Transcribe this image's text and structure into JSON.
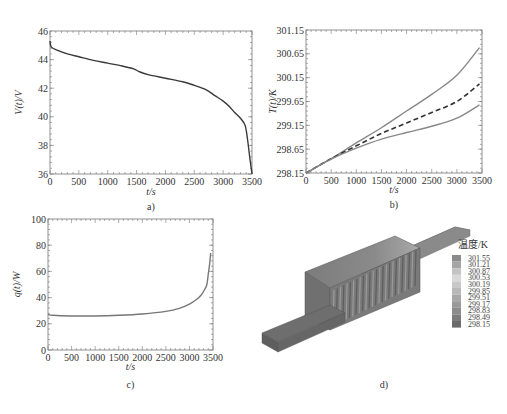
{
  "chart_data": [
    {
      "id": "a",
      "type": "line",
      "caption": "a)",
      "title": "",
      "xlabel": "t/s",
      "ylabel": "V(t)/V",
      "xlim": [
        0,
        3500
      ],
      "ylim": [
        36,
        46
      ],
      "xticks": [
        0,
        500,
        1000,
        1500,
        2000,
        2500,
        3000,
        3500
      ],
      "yticks": [
        36,
        38,
        40,
        42,
        44,
        46
      ],
      "grid": false,
      "series": [
        {
          "name": "V(t)",
          "style": "solid",
          "color": "#3a3a3a",
          "x": [
            0,
            10,
            30,
            100,
            300,
            500,
            750,
            1000,
            1250,
            1450,
            1550,
            1700,
            2000,
            2300,
            2500,
            2700,
            2850,
            3000,
            3100,
            3200,
            3300,
            3380,
            3420,
            3460,
            3500
          ],
          "y": [
            45.3,
            45.0,
            44.85,
            44.7,
            44.4,
            44.2,
            43.95,
            43.75,
            43.55,
            43.35,
            43.15,
            42.95,
            42.7,
            42.45,
            42.2,
            41.9,
            41.5,
            41.1,
            40.75,
            40.3,
            39.9,
            39.4,
            38.5,
            37.2,
            36.0
          ]
        }
      ]
    },
    {
      "id": "b",
      "type": "line",
      "caption": "b)",
      "title": "",
      "xlabel": "t/s",
      "ylabel": "T(t)/K",
      "xlim": [
        0,
        3500
      ],
      "ylim": [
        298.15,
        301.15
      ],
      "xticks": [
        0,
        500,
        1000,
        1500,
        2000,
        2500,
        3000,
        3500
      ],
      "yticks": [
        298.15,
        298.65,
        299.15,
        299.65,
        300.15,
        300.65,
        301.15
      ],
      "grid": false,
      "series": [
        {
          "name": "upper",
          "style": "solid",
          "color": "#888888",
          "x": [
            0,
            500,
            1000,
            1500,
            2000,
            2500,
            3000,
            3450
          ],
          "y": [
            298.15,
            298.45,
            298.78,
            299.1,
            299.45,
            299.8,
            300.2,
            300.78
          ]
        },
        {
          "name": "mean",
          "style": "dashed",
          "color": "#333333",
          "x": [
            0,
            500,
            1000,
            1500,
            2000,
            2500,
            3000,
            3450
          ],
          "y": [
            298.15,
            298.45,
            298.72,
            298.98,
            299.2,
            299.42,
            299.65,
            300.02
          ]
        },
        {
          "name": "lower",
          "style": "solid",
          "color": "#888888",
          "x": [
            0,
            500,
            1000,
            1500,
            2000,
            2500,
            3000,
            3450
          ],
          "y": [
            298.15,
            298.44,
            298.67,
            298.86,
            299.0,
            299.13,
            299.3,
            299.58
          ]
        }
      ]
    },
    {
      "id": "c",
      "type": "line",
      "caption": "c)",
      "title": "",
      "xlabel": "t/s",
      "ylabel": "q(t)/W",
      "xlim": [
        0,
        3500
      ],
      "ylim": [
        0,
        100
      ],
      "xticks": [
        0,
        500,
        1000,
        1500,
        2000,
        2500,
        3000,
        3500
      ],
      "yticks": [
        0,
        20,
        40,
        60,
        80,
        100
      ],
      "grid": false,
      "series": [
        {
          "name": "q(t)",
          "style": "solid",
          "color": "#777777",
          "x": [
            0,
            100,
            500,
            1000,
            1500,
            2000,
            2500,
            2800,
            3000,
            3150,
            3250,
            3320,
            3370,
            3400,
            3430,
            3450
          ],
          "y": [
            27.2,
            26.5,
            26.0,
            26.0,
            26.5,
            27.5,
            29.5,
            32,
            35,
            38.5,
            42,
            46,
            50,
            58,
            66,
            74
          ]
        }
      ]
    },
    {
      "id": "d",
      "type": "heatmap",
      "caption": "d)",
      "title": "",
      "description": "3D temperature contour of battery module",
      "legend_title": "温度/K",
      "legend_values": [
        "301.55",
        "301.21",
        "300.87",
        "300.53",
        "300.19",
        "299.85",
        "299.51",
        "299.17",
        "298.83",
        "298.49",
        "298.15"
      ],
      "legend_colors": [
        "#8a8a8a",
        "#a5a5a5",
        "#c4c4c4",
        "#d8d8d8",
        "#c8c8c8",
        "#b8b8b8",
        "#a8a8a8",
        "#9a9a9a",
        "#8c8c8c",
        "#7c7c7c",
        "#6a6a6a"
      ]
    }
  ]
}
